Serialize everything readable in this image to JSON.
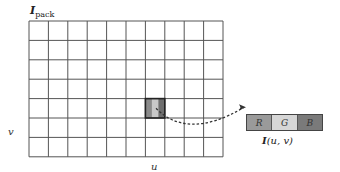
{
  "title": {
    "main": "I",
    "sub": "pack"
  },
  "axes": {
    "u_label": "u",
    "v_label": "v"
  },
  "grid": {
    "cols": 10,
    "rows": 7,
    "left": 29,
    "top": 21,
    "cell": 19.4,
    "line_color": "#555555"
  },
  "highlight": {
    "col": 6,
    "row": 4,
    "colors": [
      "#8a8a8a",
      "#c8c8c8",
      "#6e6e6e"
    ]
  },
  "pixel": {
    "channels": [
      {
        "label": "R",
        "color": "#9a9a9a"
      },
      {
        "label": "G",
        "color": "#d6d6d6"
      },
      {
        "label": "B",
        "color": "#7a7a7a"
      }
    ],
    "label_main": "I",
    "label_args": "(u, v)"
  }
}
